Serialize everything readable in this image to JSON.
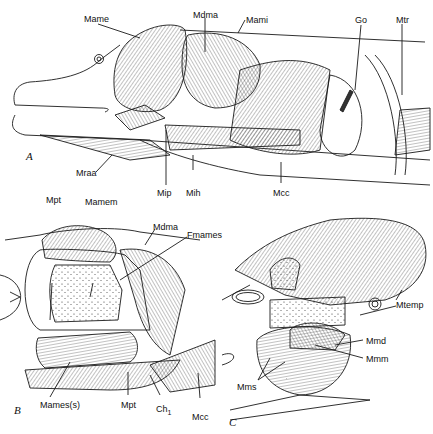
{
  "figure": {
    "panels": [
      {
        "id": "A",
        "letter": "A",
        "labels": {
          "mame": "Mame",
          "mdma": "Mdma",
          "mami": "Mami",
          "go": "Go",
          "mtr": "Mtr",
          "mraa": "Mraa",
          "mip": "Mip",
          "mih": "Mih",
          "mcc": "Mcc"
        }
      },
      {
        "id": "B",
        "letter": "B",
        "labels": {
          "mpt_top": "Mpt",
          "mamem": "Mamem",
          "mdma": "Mdma",
          "fmames": "Fmames",
          "mames_s": "Mames(s)",
          "mpt_bottom": "Mpt",
          "ch1": "Ch",
          "ch1_sub": "1",
          "mcc": "Mcc"
        }
      },
      {
        "id": "C",
        "letter": "C",
        "labels": {
          "mtemp": "Mtemp",
          "mmd": "Mmd",
          "mmm": "Mmm",
          "mms": "Mms"
        }
      }
    ],
    "colors": {
      "ink": "#1a1a1a",
      "background": "#ffffff"
    }
  }
}
